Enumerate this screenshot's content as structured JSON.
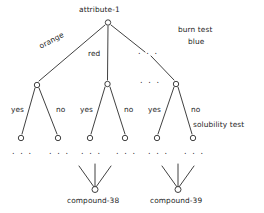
{
  "diagram": {
    "type": "decision-tree",
    "title_node": "attribute-1",
    "stroke_color": "#2b2b2b",
    "node_fill": "#ffffff",
    "text_color": "#1c1c1c"
  },
  "nodes": {
    "root": {
      "label": "attribute-1",
      "x": 108,
      "y": 22
    },
    "level2": [
      {
        "label": "",
        "x": 37,
        "y": 85
      },
      {
        "label": "",
        "x": 107,
        "y": 84
      },
      {
        "label": "",
        "x": 176,
        "y": 84
      }
    ],
    "leaves": [
      {
        "x": 21,
        "y": 138
      },
      {
        "x": 58,
        "y": 138
      },
      {
        "x": 90,
        "y": 138
      },
      {
        "x": 125,
        "y": 138
      },
      {
        "x": 157,
        "y": 138
      },
      {
        "x": 193,
        "y": 138
      }
    ],
    "compounds": [
      {
        "label": "compound-38",
        "x": 95,
        "y": 190
      },
      {
        "label": "compound-39",
        "x": 178,
        "y": 190
      }
    ]
  },
  "edge_labels": {
    "orange": "orange",
    "red": "red",
    "burn_test": "burn test",
    "blue": "blue",
    "yes_1": "yes",
    "no_1": "no",
    "yes_2": "yes",
    "no_2": "no",
    "yes_3": "yes",
    "no_3": "no",
    "solubility_test": "solubility test"
  },
  "ellipses": {
    "root_branch": ". . .",
    "mid_level": ". . .",
    "under_leaf_1": ". . .",
    "under_leaf_2": ". . .",
    "under_leaf_3": ". . .",
    "under_leaf_4": ". . .",
    "under_leaf_5": ". . .",
    "under_leaf_6": ". . ."
  }
}
